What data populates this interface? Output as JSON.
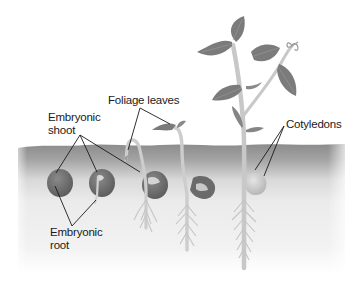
{
  "diagram": {
    "labels": {
      "embryonic_shoot": [
        "Embryonic",
        "shoot"
      ],
      "foliage_leaves": "Foliage leaves",
      "cotyledons": "Cotyledons",
      "embryonic_root": [
        "Embryonic",
        "root"
      ]
    },
    "stages": [
      {
        "id": 1,
        "description": "Whole seed in soil"
      },
      {
        "id": 2,
        "description": "Seed with emerging embryonic root and shoot"
      },
      {
        "id": 3,
        "description": "Hooked shoot emerging from soil, roots forming"
      },
      {
        "id": 4,
        "description": "Shoot above soil with foliage leaves unfolding"
      },
      {
        "id": 5,
        "description": "Mature seedling with foliage leaves, tendril, and cotyledons"
      }
    ],
    "colors": {
      "soil_dark": "#8a8a8a",
      "soil_light": "#efefef",
      "seed": "#6e6e6e",
      "stem": "#c9c9c9",
      "leaf": "#7d7d7d",
      "leader_line": "#1a1a1a",
      "label_text": "#1a1a1a"
    }
  }
}
